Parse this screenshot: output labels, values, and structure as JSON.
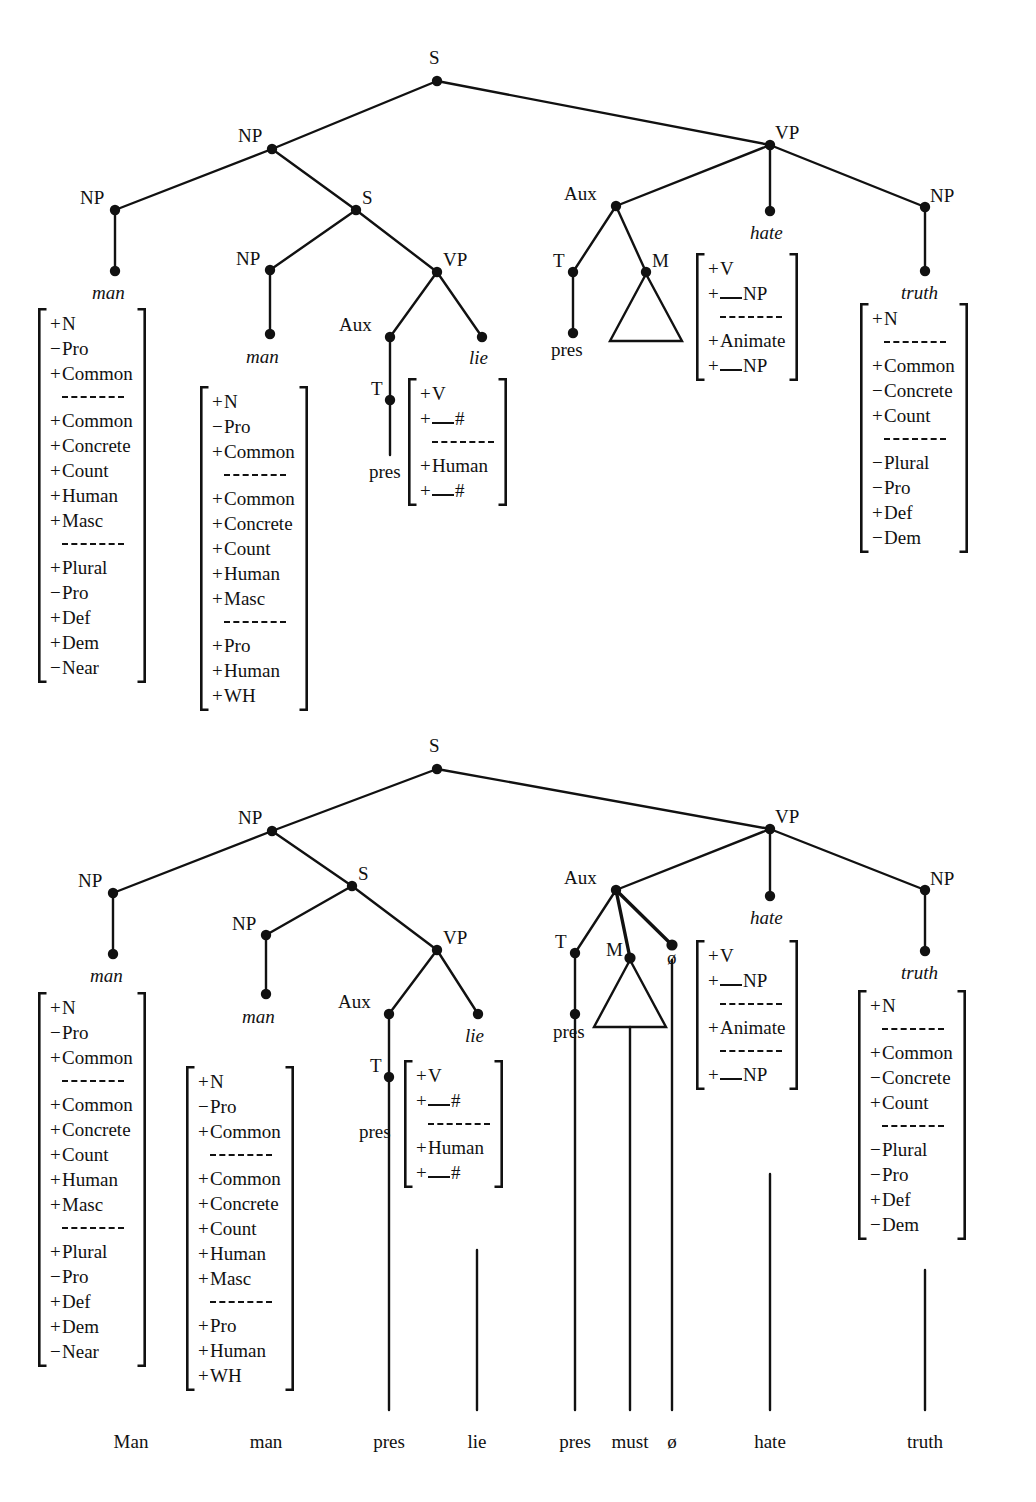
{
  "figure": {
    "type": "syntax-tree-diagram",
    "domain": "linguistics-generative-grammar",
    "trees": 2
  },
  "tree1": {
    "nodes": {
      "s_root": "S",
      "np_subject": "NP",
      "np_head": "NP",
      "s_embedded": "S",
      "np_rel": "NP",
      "vp_rel": "VP",
      "aux_rel": "Aux",
      "t_rel": "T",
      "pres_rel": "pres",
      "vp_main": "VP",
      "aux_main": "Aux",
      "t_main": "T",
      "pres_main": "pres",
      "m_main": "M",
      "np_object": "NP"
    },
    "lexical": {
      "man_outer": "man",
      "man_inner": "man",
      "lie": "lie",
      "hate": "hate",
      "truth": "truth"
    },
    "matrices": {
      "man_outer": [
        {
          "sign": "+",
          "name": "N"
        },
        {
          "sign": "−",
          "name": "Pro"
        },
        {
          "sign": "+",
          "name": "Common"
        },
        {
          "sign": "dash"
        },
        {
          "sign": "+",
          "name": "Common"
        },
        {
          "sign": "+",
          "name": "Concrete"
        },
        {
          "sign": "+",
          "name": "Count"
        },
        {
          "sign": "+",
          "name": "Human"
        },
        {
          "sign": "+",
          "name": "Masc"
        },
        {
          "sign": "dash"
        },
        {
          "sign": "+",
          "name": "Plural"
        },
        {
          "sign": "−",
          "name": "Pro"
        },
        {
          "sign": "+",
          "name": "Def"
        },
        {
          "sign": "+",
          "name": "Dem"
        },
        {
          "sign": "−",
          "name": "Near"
        }
      ],
      "man_inner": [
        {
          "sign": "+",
          "name": "N"
        },
        {
          "sign": "−",
          "name": "Pro"
        },
        {
          "sign": "+",
          "name": "Common"
        },
        {
          "sign": "dash"
        },
        {
          "sign": "+",
          "name": "Common"
        },
        {
          "sign": "+",
          "name": "Concrete"
        },
        {
          "sign": "+",
          "name": "Count"
        },
        {
          "sign": "+",
          "name": "Human"
        },
        {
          "sign": "+",
          "name": "Masc"
        },
        {
          "sign": "dash"
        },
        {
          "sign": "+",
          "name": "Pro"
        },
        {
          "sign": "+",
          "name": "Human"
        },
        {
          "sign": "+",
          "name": "WH"
        }
      ],
      "lie": [
        {
          "sign": "+",
          "name": "V"
        },
        {
          "sign": "+",
          "name": "__#",
          "blank": true,
          "after": "#"
        },
        {
          "sign": "dash"
        },
        {
          "sign": "+",
          "name": "Human"
        },
        {
          "sign": "+",
          "name": "__#",
          "blank": true,
          "after": "#"
        }
      ],
      "hate": [
        {
          "sign": "+",
          "name": "V"
        },
        {
          "sign": "+",
          "name": "__NP",
          "blank": true,
          "after": "NP"
        },
        {
          "sign": "dash"
        },
        {
          "sign": "+",
          "name": "Animate"
        },
        {
          "sign": "+",
          "name": "__NP",
          "blank": true,
          "after": "NP"
        }
      ],
      "truth": [
        {
          "sign": "+",
          "name": "N"
        },
        {
          "sign": "dash"
        },
        {
          "sign": "+",
          "name": "Common"
        },
        {
          "sign": "−",
          "name": "Concrete"
        },
        {
          "sign": "+",
          "name": "Count"
        },
        {
          "sign": "dash"
        },
        {
          "sign": "−",
          "name": "Plural"
        },
        {
          "sign": "−",
          "name": "Pro"
        },
        {
          "sign": "+",
          "name": "Def"
        },
        {
          "sign": "−",
          "name": "Dem"
        }
      ]
    }
  },
  "tree2": {
    "nodes": {
      "s_root": "S",
      "np_subject": "NP",
      "np_head": "NP",
      "s_embedded": "S",
      "np_rel": "NP",
      "vp_rel": "VP",
      "aux_rel": "Aux",
      "t_rel": "T",
      "pres_rel": "pres",
      "vp_main": "VP",
      "aux_main": "Aux",
      "t_main": "T",
      "pres_main": "pres",
      "m_main": "M",
      "null_node": "ø",
      "np_object": "NP"
    },
    "lexical": {
      "man_outer": "man",
      "man_inner": "man",
      "lie": "lie",
      "hate": "hate",
      "truth": "truth"
    },
    "matrices": {
      "man_outer": [
        {
          "sign": "+",
          "name": "N"
        },
        {
          "sign": "−",
          "name": "Pro"
        },
        {
          "sign": "+",
          "name": "Common"
        },
        {
          "sign": "dash"
        },
        {
          "sign": "+",
          "name": "Common"
        },
        {
          "sign": "+",
          "name": "Concrete"
        },
        {
          "sign": "+",
          "name": "Count"
        },
        {
          "sign": "+",
          "name": "Human"
        },
        {
          "sign": "+",
          "name": "Masc"
        },
        {
          "sign": "dash"
        },
        {
          "sign": "+",
          "name": "Plural"
        },
        {
          "sign": "−",
          "name": "Pro"
        },
        {
          "sign": "+",
          "name": "Def"
        },
        {
          "sign": "+",
          "name": "Dem"
        },
        {
          "sign": "−",
          "name": "Near"
        }
      ],
      "man_inner": [
        {
          "sign": "+",
          "name": "N"
        },
        {
          "sign": "−",
          "name": "Pro"
        },
        {
          "sign": "+",
          "name": "Common"
        },
        {
          "sign": "dash"
        },
        {
          "sign": "+",
          "name": "Common"
        },
        {
          "sign": "+",
          "name": "Concrete"
        },
        {
          "sign": "+",
          "name": "Count"
        },
        {
          "sign": "+",
          "name": "Human"
        },
        {
          "sign": "+",
          "name": "Masc"
        },
        {
          "sign": "dash"
        },
        {
          "sign": "+",
          "name": "Pro"
        },
        {
          "sign": "+",
          "name": "Human"
        },
        {
          "sign": "+",
          "name": "WH"
        }
      ],
      "lie": [
        {
          "sign": "+",
          "name": "V"
        },
        {
          "sign": "+",
          "name": "__#",
          "blank": true,
          "after": "#"
        },
        {
          "sign": "dash"
        },
        {
          "sign": "+",
          "name": "Human"
        },
        {
          "sign": "+",
          "name": "__#",
          "blank": true,
          "after": "#"
        }
      ],
      "hate": [
        {
          "sign": "+",
          "name": "V"
        },
        {
          "sign": "+",
          "name": "__NP",
          "blank": true,
          "after": "NP"
        },
        {
          "sign": "dash"
        },
        {
          "sign": "+",
          "name": "Animate"
        },
        {
          "sign": "dash"
        },
        {
          "sign": "+",
          "name": "__NP",
          "blank": true,
          "after": "NP"
        }
      ],
      "truth": [
        {
          "sign": "+",
          "name": "N"
        },
        {
          "sign": "dash"
        },
        {
          "sign": "+",
          "name": "Common"
        },
        {
          "sign": "−",
          "name": "Concrete"
        },
        {
          "sign": "+",
          "name": "Count"
        },
        {
          "sign": "dash"
        },
        {
          "sign": "−",
          "name": "Plural"
        },
        {
          "sign": "−",
          "name": "Pro"
        },
        {
          "sign": "+",
          "name": "Def"
        },
        {
          "sign": "−",
          "name": "Dem"
        }
      ]
    }
  },
  "terminal_string": {
    "words": [
      "Man",
      "man",
      "pres",
      "lie",
      "pres",
      "must",
      "ø",
      "hate",
      "truth"
    ]
  },
  "colors": {
    "ink": "#111111",
    "paper": "#ffffff"
  }
}
